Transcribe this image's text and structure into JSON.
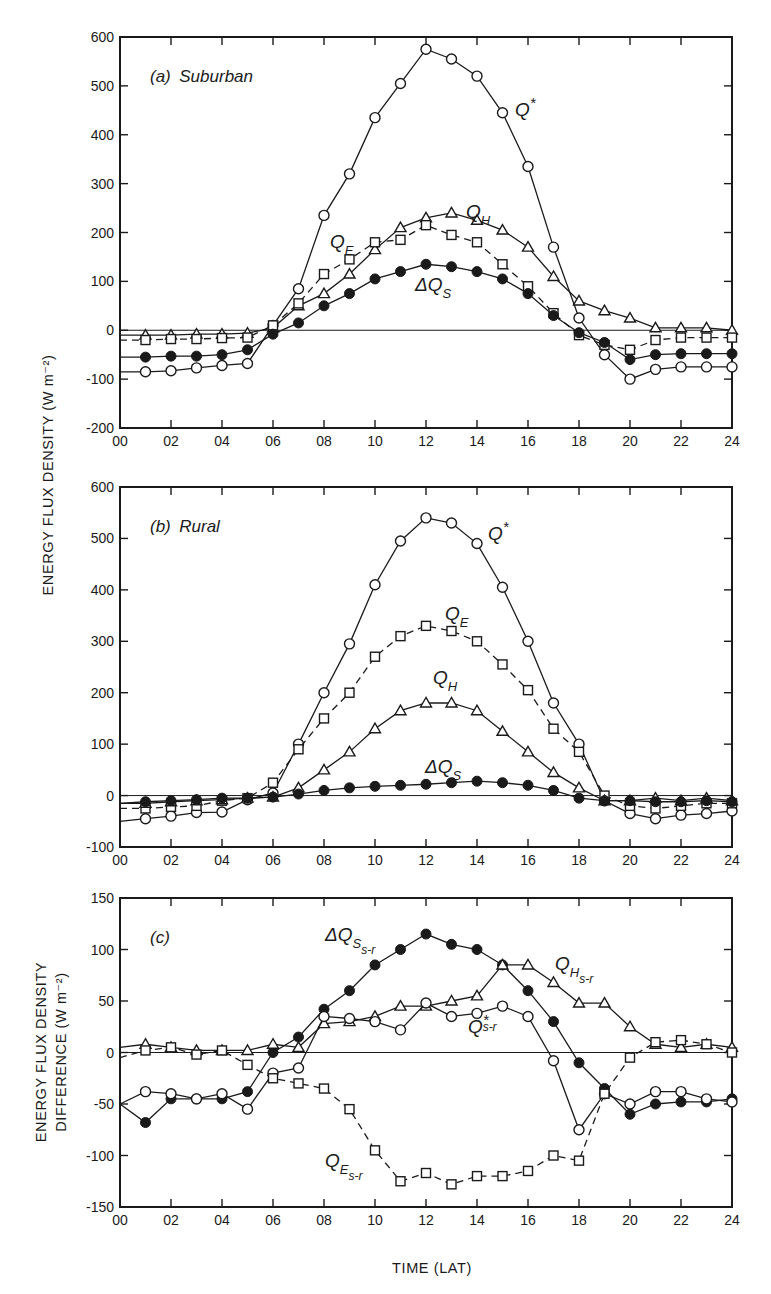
{
  "figure": {
    "y_axis_label_top": "ENERGY FLUX DENSITY (W m⁻²)",
    "y_axis_label_bottom_line1": "ENERGY FLUX DENSITY",
    "y_axis_label_bottom_line2": "DIFFERENCE (W m⁻²)",
    "x_axis_label": "TIME (LAT)"
  },
  "chart_data": [
    {
      "type": "line",
      "title": "(a) Suburban",
      "xlabel": "TIME (LAT)",
      "ylabel": "ENERGY FLUX DENSITY (W m-2)",
      "x": [
        0,
        1,
        2,
        3,
        4,
        5,
        6,
        7,
        8,
        9,
        10,
        11,
        12,
        13,
        14,
        15,
        16,
        17,
        18,
        19,
        20,
        21,
        22,
        23,
        24
      ],
      "xticks": [
        "00",
        "02",
        "04",
        "06",
        "08",
        "10",
        "12",
        "14",
        "16",
        "18",
        "20",
        "22",
        "24"
      ],
      "ylim": [
        -200,
        600
      ],
      "yticks": [
        -200,
        -100,
        0,
        100,
        200,
        300,
        400,
        500,
        600
      ],
      "grid": false,
      "series": [
        {
          "name": "Q*",
          "marker": "open-circle",
          "dash": false,
          "values": [
            -85,
            -85,
            -83,
            -77,
            -72,
            -68,
            10,
            85,
            235,
            320,
            435,
            505,
            575,
            555,
            520,
            445,
            335,
            170,
            25,
            -50,
            -100,
            -80,
            -75,
            -75,
            -75
          ]
        },
        {
          "name": "QH",
          "marker": "open-triangle",
          "dash": false,
          "values": [
            -10,
            -10,
            -10,
            -8,
            -8,
            -6,
            5,
            50,
            75,
            115,
            165,
            210,
            230,
            240,
            225,
            205,
            170,
            110,
            60,
            40,
            25,
            5,
            5,
            5,
            0
          ]
        },
        {
          "name": "QE",
          "marker": "open-square",
          "dash": true,
          "values": [
            -20,
            -20,
            -18,
            -18,
            -16,
            -15,
            10,
            55,
            115,
            145,
            180,
            185,
            215,
            195,
            180,
            135,
            90,
            35,
            -10,
            -30,
            -40,
            -20,
            -15,
            -15,
            -15
          ]
        },
        {
          "name": "ΔQS",
          "marker": "filled-circle",
          "dash": false,
          "values": [
            -55,
            -55,
            -53,
            -53,
            -50,
            -40,
            -8,
            15,
            50,
            75,
            105,
            120,
            135,
            130,
            120,
            105,
            75,
            30,
            -5,
            -25,
            -60,
            -50,
            -48,
            -48,
            -48
          ]
        }
      ]
    },
    {
      "type": "line",
      "title": "(b) Rural",
      "xlabel": "TIME (LAT)",
      "ylabel": "ENERGY FLUX DENSITY (W m-2)",
      "x": [
        0,
        1,
        2,
        3,
        4,
        5,
        6,
        7,
        8,
        9,
        10,
        11,
        12,
        13,
        14,
        15,
        16,
        17,
        18,
        19,
        20,
        21,
        22,
        23,
        24
      ],
      "xticks": [
        "00",
        "02",
        "04",
        "06",
        "08",
        "10",
        "12",
        "14",
        "16",
        "18",
        "20",
        "22",
        "24"
      ],
      "ylim": [
        -100,
        600
      ],
      "yticks": [
        -100,
        0,
        100,
        200,
        300,
        400,
        500,
        600
      ],
      "grid": false,
      "series": [
        {
          "name": "Q*",
          "marker": "open-circle",
          "dash": false,
          "values": [
            -50,
            -45,
            -40,
            -33,
            -32,
            -8,
            5,
            100,
            200,
            295,
            410,
            495,
            540,
            530,
            490,
            405,
            300,
            180,
            100,
            -10,
            -35,
            -45,
            -38,
            -35,
            -30
          ]
        },
        {
          "name": "QE",
          "marker": "open-square",
          "dash": true,
          "values": [
            -25,
            -25,
            -22,
            -20,
            -10,
            -5,
            25,
            90,
            150,
            200,
            270,
            310,
            330,
            320,
            300,
            255,
            205,
            130,
            85,
            0,
            -20,
            -25,
            -20,
            -15,
            -15
          ]
        },
        {
          "name": "QH",
          "marker": "open-triangle",
          "dash": false,
          "values": [
            -15,
            -15,
            -12,
            -10,
            -8,
            -5,
            -3,
            15,
            50,
            85,
            130,
            165,
            180,
            180,
            165,
            125,
            85,
            45,
            15,
            -10,
            -10,
            -5,
            -10,
            -5,
            -10
          ]
        },
        {
          "name": "ΔQS",
          "marker": "filled-circle",
          "dash": false,
          "values": [
            -15,
            -12,
            -10,
            -8,
            -5,
            -5,
            -3,
            3,
            10,
            15,
            18,
            20,
            22,
            25,
            28,
            25,
            20,
            10,
            -5,
            -10,
            -10,
            -12,
            -12,
            -10,
            -12
          ]
        }
      ]
    },
    {
      "type": "line",
      "title": "(c)",
      "xlabel": "TIME (LAT)",
      "ylabel": "ENERGY FLUX DENSITY DIFFERENCE (W m-2)",
      "x": [
        0,
        1,
        2,
        3,
        4,
        5,
        6,
        7,
        8,
        9,
        10,
        11,
        12,
        13,
        14,
        15,
        16,
        17,
        18,
        19,
        20,
        21,
        22,
        23,
        24
      ],
      "xticks": [
        "00",
        "02",
        "04",
        "06",
        "08",
        "10",
        "12",
        "14",
        "16",
        "18",
        "20",
        "22",
        "24"
      ],
      "ylim": [
        -150,
        150
      ],
      "yticks": [
        -150,
        -100,
        -50,
        0,
        50,
        100,
        150
      ],
      "grid": false,
      "series": [
        {
          "name": "ΔQS s-r",
          "marker": "filled-circle",
          "dash": false,
          "values": [
            -50,
            -68,
            -45,
            -45,
            -45,
            -38,
            0,
            15,
            42,
            60,
            85,
            100,
            115,
            105,
            100,
            85,
            60,
            30,
            -10,
            -35,
            -60,
            -50,
            -48,
            -48,
            -45
          ]
        },
        {
          "name": "QH s-r",
          "marker": "open-triangle",
          "dash": false,
          "values": [
            5,
            8,
            5,
            2,
            2,
            2,
            8,
            5,
            28,
            30,
            35,
            45,
            45,
            50,
            55,
            85,
            85,
            68,
            48,
            48,
            25,
            8,
            5,
            8,
            5
          ]
        },
        {
          "name": "Q* s-r",
          "marker": "open-circle",
          "dash": false,
          "values": [
            -50,
            -38,
            -40,
            -45,
            -40,
            -55,
            -20,
            -15,
            35,
            33,
            30,
            22,
            48,
            35,
            38,
            45,
            35,
            -8,
            -75,
            -40,
            -50,
            -38,
            -38,
            -45,
            -48
          ]
        },
        {
          "name": "QE s-r",
          "marker": "open-square",
          "dash": true,
          "values": [
            -5,
            2,
            5,
            -2,
            2,
            -12,
            -25,
            -30,
            -35,
            -55,
            -95,
            -125,
            -117,
            -128,
            -120,
            -120,
            -115,
            -100,
            -105,
            -40,
            -5,
            10,
            12,
            8,
            0
          ]
        }
      ]
    }
  ],
  "labels": {
    "a": {
      "Qstar": "Q",
      "Qstar_sup": "*",
      "QH": "Q",
      "QH_sub": "H",
      "QE": "Q",
      "QE_sub": "E",
      "dQS": "ΔQ",
      "dQS_sub": "S"
    },
    "b": {
      "Qstar": "Q",
      "Qstar_sup": "*",
      "QH": "Q",
      "QH_sub": "H",
      "QE": "Q",
      "QE_sub": "E",
      "dQS": "ΔQ",
      "dQS_sub": "S"
    },
    "c": {
      "dQS": "ΔQ",
      "dQS_sub": "S",
      "dQS_subsub": "s-r",
      "QH": "Q",
      "QH_sub": "H",
      "QH_subsub": "s-r",
      "Qstar": "Q",
      "Qstar_sup": "*",
      "Qstar_subsub": "s-r",
      "QE": "Q",
      "QE_sub": "E",
      "QE_subsub": "s-r"
    }
  }
}
